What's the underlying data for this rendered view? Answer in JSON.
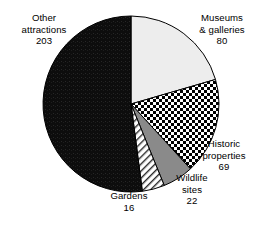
{
  "chart_data": {
    "type": "pie",
    "title": "",
    "subtitle": "",
    "xlabel": "",
    "ylabel": "",
    "legend_position": "none",
    "grid": false,
    "total": 390,
    "categories": [
      "Museums & galleries",
      "Historic properties",
      "Wildlife sites",
      "Gardens",
      "Other attractions"
    ],
    "values": [
      80,
      69,
      22,
      16,
      203
    ],
    "slices": [
      {
        "name": "Museums & galleries",
        "label_lines": [
          "Museums",
          "& galleries",
          "80"
        ],
        "value": 80,
        "percent": 20.5,
        "start_angle": 0,
        "end_angle": 73.8,
        "fill": "light-gray-solid",
        "color": "#ededed"
      },
      {
        "name": "Historic properties",
        "label_lines": [
          "Historic",
          "properties",
          "69"
        ],
        "value": 69,
        "percent": 17.7,
        "start_angle": 73.8,
        "end_angle": 137.5,
        "fill": "checkerboard",
        "color": "#000000"
      },
      {
        "name": "Wildlife sites",
        "label_lines": [
          "Wildlife",
          "sites",
          "22"
        ],
        "value": 22,
        "percent": 5.6,
        "start_angle": 137.5,
        "end_angle": 157.8,
        "fill": "medium-gray-solid",
        "color": "#8a8a8a"
      },
      {
        "name": "Gardens",
        "label_lines": [
          "Gardens",
          "16"
        ],
        "value": 16,
        "percent": 4.1,
        "start_angle": 157.8,
        "end_angle": 172.6,
        "fill": "diagonal-hatch",
        "color": "#ffffff"
      },
      {
        "name": "Other attractions",
        "label_lines": [
          "Other",
          "attractions",
          "203"
        ],
        "value": 203,
        "percent": 52.1,
        "start_angle": 172.6,
        "end_angle": 360,
        "fill": "black-solid",
        "color": "#111111"
      }
    ],
    "geometry": {
      "cx": 131,
      "cy": 104,
      "r": 88,
      "start_at": "12-o-clock",
      "direction": "clockwise"
    }
  },
  "labels": {
    "other": {
      "l1": "Other",
      "l2": "attractions",
      "l3": "203"
    },
    "museums": {
      "l1": "Museums",
      "l2": "& galleries",
      "l3": "80"
    },
    "historic": {
      "l1": "Historic",
      "l2": "properties",
      "l3": "69"
    },
    "wildlife": {
      "l1": "Wildlife",
      "l2": "sites",
      "l3": "22"
    },
    "gardens": {
      "l1": "Gardens",
      "l2": "16"
    }
  }
}
